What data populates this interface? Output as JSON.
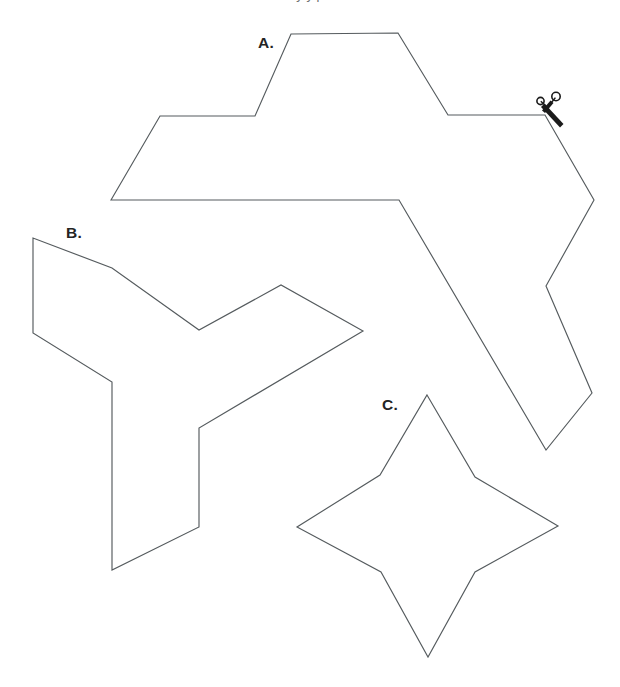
{
  "page": {
    "background_color": "#ffffff",
    "width": 620,
    "height": 687,
    "clipped_top_caption": "y y p"
  },
  "style": {
    "outline_color": "#555b5e",
    "outline_width": 1.15,
    "label_color": "#242424",
    "scissors_color": "#1b1b1b"
  },
  "labels": {
    "a": "A.",
    "b": "B.",
    "c": "C."
  },
  "shapes": [
    {
      "id": "a",
      "label": "A.",
      "name": "irregular-polygon-a",
      "label_x": 258,
      "label_y": 48,
      "points": "111,200 160,116 255,116 291,34 398,33 448,115 545,115 594,200 546,286 592,393 546,450 399,200"
    },
    {
      "id": "b",
      "label": "B.",
      "name": "triskelion-polygon-b",
      "label_x": 66,
      "label_y": 238,
      "points": "33,238 33,333 112,382 112,570 199,527 199,428 363,331 281,285 199,330 112,268"
    },
    {
      "id": "c",
      "label": "C.",
      "name": "four-pointed-star-c",
      "label_x": 382,
      "label_y": 410,
      "points": "427,395 475,477 558,526 475,572 428,657 381,572 297,527 380,475"
    }
  ],
  "scissors": {
    "name": "scissors-icon",
    "x": 545,
    "y": 115,
    "rings": [
      {
        "cx": 540.5,
        "cy": 101.0,
        "r": 3.6
      },
      {
        "cx": 556.0,
        "cy": 96.5,
        "r": 4.2
      }
    ],
    "description": "cut-here scissors on edge of shape A"
  }
}
